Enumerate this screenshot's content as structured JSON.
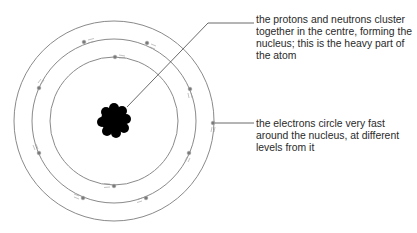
{
  "diagram": {
    "colors": {
      "orbit": "#8a8a8a",
      "electron": "#7a7a7a",
      "nucleus": "#000000",
      "leader": "#444444",
      "text": "#2a2a2a"
    },
    "center": {
      "x": 114,
      "y": 121
    },
    "orbits": [
      {
        "name": "inner",
        "r": 64
      },
      {
        "name": "middle",
        "r": 82
      },
      {
        "name": "outer",
        "r": 100
      }
    ],
    "electrons": [
      {
        "orbit": "inner",
        "x": 115,
        "y": 57
      },
      {
        "orbit": "inner",
        "x": 114,
        "y": 186
      },
      {
        "orbit": "middle",
        "x": 84,
        "y": 42
      },
      {
        "orbit": "middle",
        "x": 147,
        "y": 43
      },
      {
        "orbit": "middle",
        "x": 190,
        "y": 89
      },
      {
        "orbit": "middle",
        "x": 39,
        "y": 88
      },
      {
        "orbit": "middle",
        "x": 39,
        "y": 153
      },
      {
        "orbit": "middle",
        "x": 189,
        "y": 153
      },
      {
        "orbit": "middle",
        "x": 83,
        "y": 198
      },
      {
        "orbit": "middle",
        "x": 146,
        "y": 198
      },
      {
        "orbit": "outer",
        "x": 213,
        "y": 123
      }
    ],
    "labels": {
      "nucleus": "the protons and neutrons cluster together in the centre, forming the nucleus; this is the heavy part of the atom",
      "electrons": "the electrons circle very fast around the nucleus, at different levels from it"
    }
  }
}
